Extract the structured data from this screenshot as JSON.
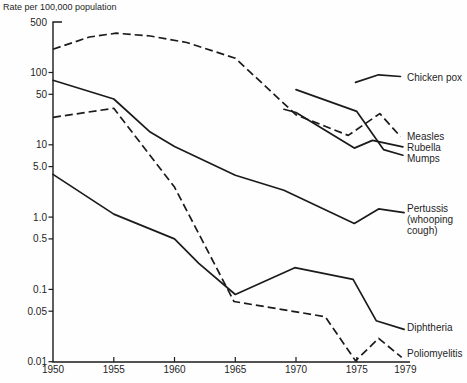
{
  "title": "Rate per 100,000 population",
  "chart_data": {
    "type": "line",
    "title": "Rate per 100,000 population",
    "xlabel": "",
    "ylabel": "Rate per 100,000 population",
    "x_range": [
      1950,
      1979
    ],
    "y_scale": "log",
    "y_range": [
      0.01,
      500
    ],
    "grid": false,
    "legend_position": "direct labels at right end of each line",
    "x_ticks": [
      {
        "label": "1950",
        "year": 1950,
        "tick": false
      },
      {
        "label": "1955",
        "year": 1955,
        "tick": true
      },
      {
        "label": "1960",
        "year": 1960,
        "tick": true
      },
      {
        "label": "1965",
        "year": 1965,
        "tick": true
      },
      {
        "label": "1970",
        "year": 1970,
        "tick": true
      },
      {
        "label": "1975",
        "year": 1975,
        "tick": true
      },
      {
        "label": "1979",
        "year": 1979,
        "tick": false
      }
    ],
    "y_ticks": [
      {
        "label": "500",
        "value": 500
      },
      {
        "label": "100",
        "value": 100
      },
      {
        "label": "50",
        "value": 50
      },
      {
        "label": "10",
        "value": 10
      },
      {
        "label": "5.0",
        "value": 5
      },
      {
        "label": "1.0",
        "value": 1
      },
      {
        "label": "0.5",
        "value": 0.5
      },
      {
        "label": "0.1",
        "value": 0.1
      },
      {
        "label": "0.05",
        "value": 0.05
      },
      {
        "label": "0.01",
        "value": 0.01
      }
    ],
    "series": [
      {
        "name": "Chicken pox",
        "line_style": "solid",
        "points": [
          [
            1974.9,
            73
          ],
          [
            1976.8,
            93
          ],
          [
            1978.6,
            88
          ]
        ],
        "label": {
          "lines": [
            "Chicken pox"
          ],
          "x": 407,
          "y": 81
        }
      },
      {
        "name": "Measles",
        "line_style": "dashed",
        "points": [
          [
            1950,
            210
          ],
          [
            1953,
            310
          ],
          [
            1955.2,
            350
          ],
          [
            1958,
            320
          ],
          [
            1961,
            260
          ],
          [
            1965,
            158
          ],
          [
            1970,
            26
          ],
          [
            1974.3,
            13.5
          ],
          [
            1976.9,
            27
          ],
          [
            1978.6,
            13
          ]
        ],
        "label": {
          "lines": [
            "Measles"
          ],
          "x": 407,
          "y": 140
        }
      },
      {
        "name": "Rubella",
        "line_style": "solid",
        "points": [
          [
            1969,
            31
          ],
          [
            1970,
            28
          ],
          [
            1974.8,
            9
          ],
          [
            1976.3,
            11.5
          ],
          [
            1978.8,
            9.4
          ]
        ],
        "label": {
          "lines": [
            "Rubella"
          ],
          "x": 407,
          "y": 151
        }
      },
      {
        "name": "Mumps",
        "line_style": "solid",
        "points": [
          [
            1970,
            58
          ],
          [
            1975,
            29
          ],
          [
            1977.2,
            8.6
          ],
          [
            1978.8,
            7.2
          ]
        ],
        "label": {
          "lines": [
            "Mumps"
          ],
          "x": 407,
          "y": 162
        }
      },
      {
        "name": "Pertussis (whooping cough)",
        "line_style": "solid",
        "points": [
          [
            1950,
            78
          ],
          [
            1955,
            43
          ],
          [
            1958,
            15
          ],
          [
            1960,
            9.5
          ],
          [
            1965,
            3.8
          ],
          [
            1969,
            2.35
          ],
          [
            1974.8,
            0.82
          ],
          [
            1976.8,
            1.3
          ],
          [
            1978.9,
            1.15
          ]
        ],
        "label": {
          "lines": [
            "Pertussis",
            "(whooping",
            "cough)"
          ],
          "x": 407,
          "y": 212
        }
      },
      {
        "name": "Diphtheria",
        "line_style": "solid",
        "points": [
          [
            1950,
            3.9
          ],
          [
            1955,
            1.1
          ],
          [
            1960,
            0.5
          ],
          [
            1962,
            0.23
          ],
          [
            1965,
            0.085
          ],
          [
            1969.9,
            0.2
          ],
          [
            1974.7,
            0.138
          ],
          [
            1976.6,
            0.037
          ],
          [
            1978.9,
            0.028
          ]
        ],
        "label": {
          "lines": [
            "Diphtheria"
          ],
          "x": 407,
          "y": 331
        }
      },
      {
        "name": "Poliomyelitis",
        "line_style": "dashed",
        "points": [
          [
            1950,
            24
          ],
          [
            1955,
            32
          ],
          [
            1960,
            2.6
          ],
          [
            1962.7,
            0.35
          ],
          [
            1964.9,
            0.068
          ],
          [
            1972.4,
            0.042
          ],
          [
            1974.9,
            0.0103
          ],
          [
            1976.8,
            0.021
          ],
          [
            1978.7,
            0.0115
          ]
        ],
        "label": {
          "lines": [
            "Poliomyelitis"
          ],
          "x": 407,
          "y": 357
        }
      }
    ],
    "colors": {
      "line": "#1b1b1b",
      "text": "#1e1e1e",
      "background": "#fefefe"
    }
  }
}
